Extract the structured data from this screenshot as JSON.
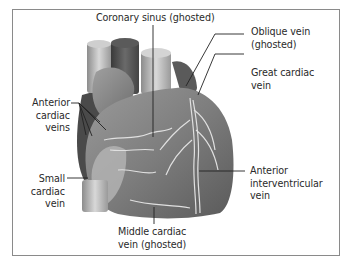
{
  "labels": {
    "coronary_sinus": "Coronary sinus (ghosted)",
    "oblique_vein_1": "Oblique vein",
    "oblique_vein_2": "(ghosted)",
    "great_cardiac_1": "Great cardiac",
    "great_cardiac_2": "vein",
    "anterior_cardiac_1": "Anterior",
    "anterior_cardiac_2": "cardiac",
    "anterior_cardiac_3": "veins",
    "small_cardiac_1": "Small",
    "small_cardiac_2": "cardiac",
    "small_cardiac_3": "vein",
    "anterior_interventricular_1": "Anterior",
    "anterior_interventricular_2": "interventricular",
    "anterior_interventricular_3": "vein",
    "middle_cardiac_1": "Middle cardiac",
    "middle_cardiac_2": "vein (ghosted)"
  },
  "colors": {
    "border": "#8a8a8a",
    "leader": "#222222",
    "heart_light": "#b8b8b8",
    "heart_dark": "#555555"
  }
}
